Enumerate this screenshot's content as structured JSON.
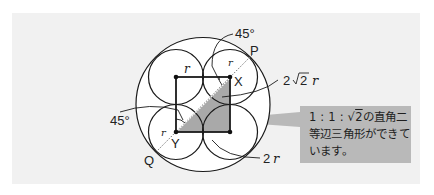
{
  "diagram": {
    "labels": {
      "angle_top": "45°",
      "angle_left": "45°",
      "point_p": "P",
      "point_q": "Q",
      "point_x": "X",
      "point_y": "Y",
      "radius_top": "r",
      "radius_tr": "r",
      "radius_bl": "r",
      "diagonal": "2√2 r",
      "diagonal_coef": "2",
      "diagonal_root": "2",
      "diagonal_var": "r",
      "two_r_coef": "2",
      "two_r_var": "r"
    },
    "callout": {
      "line1_prefix": "1 : 1 : ",
      "line1_root": "2",
      "line1_suffix": "の直角二",
      "line2": "等辺三角形ができて",
      "line3": "います。"
    },
    "colors": {
      "panel": "#f1f1f1",
      "stroke": "#1a1a1a",
      "shade": "#a9a9a9",
      "callout": "#b9b9b9"
    }
  }
}
